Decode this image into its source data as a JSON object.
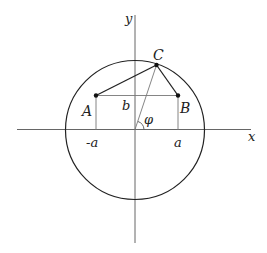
{
  "diagram": {
    "labels": {
      "x_axis": "x",
      "y_axis": "y",
      "point_a": "A",
      "point_b": "B",
      "point_c": "C",
      "b": "b",
      "neg_a": "-a",
      "pos_a": "a",
      "angle": "φ"
    },
    "colors": {
      "stroke": "#222222",
      "axis": "#555555",
      "thin": "#777777"
    }
  }
}
